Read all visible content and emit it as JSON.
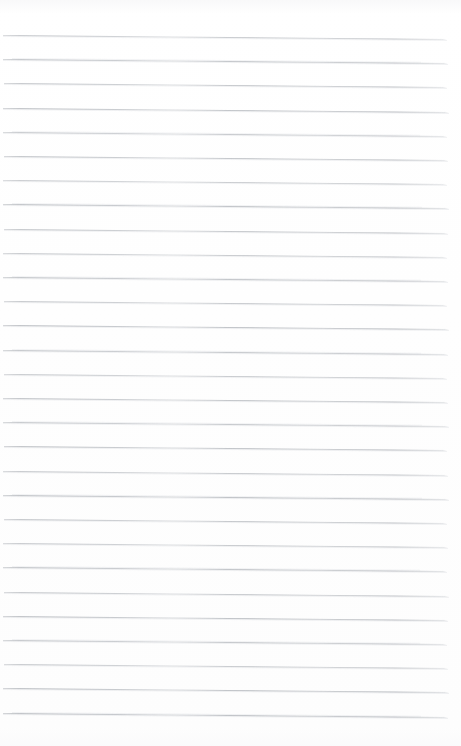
{
  "page": {
    "kind": "lined-paper-scan",
    "width_px": 461,
    "height_px": 746,
    "background_color": "#ffffff",
    "content_text": "",
    "is_blank": true
  },
  "ruling": {
    "line_color": "#9ba0a7",
    "line_color_light": "#c4c8ce",
    "line_thickness_px": 1,
    "line_count": 29,
    "line_spacing_px": 24.2,
    "first_line_y_px": 35,
    "last_line_y_px": 713,
    "left_margin_px": 3,
    "right_edge_px": 448,
    "line_length_px": 445,
    "skew_degrees": 0.52,
    "lines": [
      {
        "index": 1,
        "y": 35.0,
        "x_start": 3,
        "x_end": 447,
        "opacity": 0.72,
        "bleed": false
      },
      {
        "index": 2,
        "y": 59.2,
        "x_start": 3,
        "x_end": 448,
        "opacity": 0.8,
        "bleed": true
      },
      {
        "index": 3,
        "y": 83.4,
        "x_start": 4,
        "x_end": 447,
        "opacity": 0.76,
        "bleed": false
      },
      {
        "index": 4,
        "y": 107.6,
        "x_start": 3,
        "x_end": 449,
        "opacity": 0.82,
        "bleed": false
      },
      {
        "index": 5,
        "y": 131.8,
        "x_start": 3,
        "x_end": 447,
        "opacity": 0.74,
        "bleed": true
      },
      {
        "index": 6,
        "y": 156.0,
        "x_start": 4,
        "x_end": 448,
        "opacity": 0.79,
        "bleed": false
      },
      {
        "index": 7,
        "y": 180.2,
        "x_start": 3,
        "x_end": 447,
        "opacity": 0.71,
        "bleed": false
      },
      {
        "index": 8,
        "y": 204.4,
        "x_start": 3,
        "x_end": 449,
        "opacity": 0.83,
        "bleed": true
      },
      {
        "index": 9,
        "y": 228.6,
        "x_start": 4,
        "x_end": 448,
        "opacity": 0.77,
        "bleed": false
      },
      {
        "index": 10,
        "y": 252.8,
        "x_start": 3,
        "x_end": 447,
        "opacity": 0.73,
        "bleed": false
      },
      {
        "index": 11,
        "y": 277.0,
        "x_start": 3,
        "x_end": 448,
        "opacity": 0.81,
        "bleed": true
      },
      {
        "index": 12,
        "y": 301.2,
        "x_start": 4,
        "x_end": 447,
        "opacity": 0.75,
        "bleed": false
      },
      {
        "index": 13,
        "y": 325.4,
        "x_start": 3,
        "x_end": 449,
        "opacity": 0.84,
        "bleed": false
      },
      {
        "index": 14,
        "y": 349.6,
        "x_start": 3,
        "x_end": 448,
        "opacity": 0.78,
        "bleed": true
      },
      {
        "index": 15,
        "y": 373.8,
        "x_start": 4,
        "x_end": 447,
        "opacity": 0.72,
        "bleed": false
      },
      {
        "index": 16,
        "y": 398.0,
        "x_start": 3,
        "x_end": 448,
        "opacity": 0.8,
        "bleed": false
      },
      {
        "index": 17,
        "y": 422.2,
        "x_start": 3,
        "x_end": 449,
        "opacity": 0.76,
        "bleed": true
      },
      {
        "index": 18,
        "y": 446.4,
        "x_start": 4,
        "x_end": 447,
        "opacity": 0.82,
        "bleed": false
      },
      {
        "index": 19,
        "y": 470.6,
        "x_start": 3,
        "x_end": 448,
        "opacity": 0.74,
        "bleed": false
      },
      {
        "index": 20,
        "y": 494.8,
        "x_start": 3,
        "x_end": 449,
        "opacity": 0.85,
        "bleed": true
      },
      {
        "index": 21,
        "y": 519.0,
        "x_start": 4,
        "x_end": 447,
        "opacity": 0.77,
        "bleed": false
      },
      {
        "index": 22,
        "y": 543.2,
        "x_start": 3,
        "x_end": 448,
        "opacity": 0.73,
        "bleed": false
      },
      {
        "index": 23,
        "y": 567.4,
        "x_start": 3,
        "x_end": 447,
        "opacity": 0.81,
        "bleed": true
      },
      {
        "index": 24,
        "y": 591.6,
        "x_start": 4,
        "x_end": 449,
        "opacity": 0.75,
        "bleed": false
      },
      {
        "index": 25,
        "y": 615.8,
        "x_start": 3,
        "x_end": 448,
        "opacity": 0.83,
        "bleed": false
      },
      {
        "index": 26,
        "y": 640.0,
        "x_start": 3,
        "x_end": 447,
        "opacity": 0.78,
        "bleed": true
      },
      {
        "index": 27,
        "y": 664.2,
        "x_start": 4,
        "x_end": 448,
        "opacity": 0.72,
        "bleed": false
      },
      {
        "index": 28,
        "y": 688.4,
        "x_start": 3,
        "x_end": 449,
        "opacity": 0.84,
        "bleed": false
      },
      {
        "index": 29,
        "y": 712.6,
        "x_start": 3,
        "x_end": 448,
        "opacity": 0.86,
        "bleed": true
      }
    ]
  }
}
